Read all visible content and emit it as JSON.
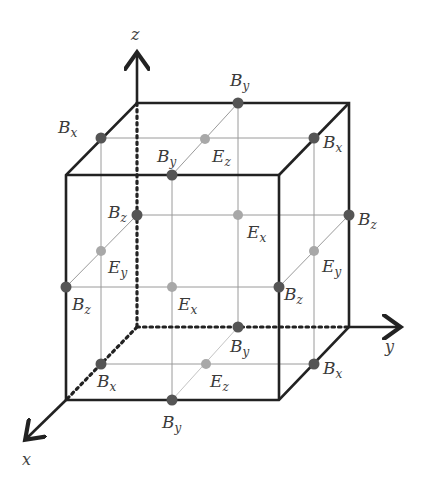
{
  "figure": {
    "colors": {
      "edge": "#222222",
      "grid_line": "#9a9a9a",
      "b_dot": "#555555",
      "e_dot": "#a8a8a8",
      "label": "#3a3a3a"
    }
  },
  "axes": {
    "x": {
      "label": "x"
    },
    "y": {
      "label": "y"
    },
    "z": {
      "label": "z"
    }
  },
  "points": [
    {
      "id": "bx-top-left",
      "field": "B",
      "comp": "x",
      "type": "B",
      "cx": 101,
      "cy": 138,
      "lx": 58,
      "ly": 133
    },
    {
      "id": "by-top-back",
      "field": "B",
      "comp": "y",
      "type": "B",
      "cx": 238,
      "cy": 103,
      "lx": 230,
      "ly": 86
    },
    {
      "id": "ez-top",
      "field": "E",
      "comp": "z",
      "type": "E",
      "cx": 205,
      "cy": 139,
      "lx": 212,
      "ly": 162
    },
    {
      "id": "bx-top-right",
      "field": "B",
      "comp": "x",
      "type": "B",
      "cx": 314,
      "cy": 138,
      "lx": 323,
      "ly": 148
    },
    {
      "id": "by-top-front",
      "field": "B",
      "comp": "y",
      "type": "B",
      "cx": 172,
      "cy": 175,
      "lx": 157,
      "ly": 162
    },
    {
      "id": "bz-back-left",
      "field": "B",
      "comp": "z",
      "type": "B",
      "cx": 137,
      "cy": 215,
      "lx": 108,
      "ly": 218
    },
    {
      "id": "ex-back",
      "field": "E",
      "comp": "x",
      "type": "E",
      "cx": 238,
      "cy": 215,
      "lx": 247,
      "ly": 238
    },
    {
      "id": "bz-back-right",
      "field": "B",
      "comp": "z",
      "type": "B",
      "cx": 349,
      "cy": 215,
      "lx": 358,
      "ly": 225
    },
    {
      "id": "ey-left",
      "field": "E",
      "comp": "y",
      "type": "E",
      "cx": 101,
      "cy": 251,
      "lx": 108,
      "ly": 273
    },
    {
      "id": "ey-right",
      "field": "E",
      "comp": "y",
      "type": "E",
      "cx": 314,
      "cy": 251,
      "lx": 322,
      "ly": 272
    },
    {
      "id": "bz-front-left",
      "field": "B",
      "comp": "z",
      "type": "B",
      "cx": 66,
      "cy": 287,
      "lx": 72,
      "ly": 310
    },
    {
      "id": "ex-front",
      "field": "E",
      "comp": "x",
      "type": "E",
      "cx": 172,
      "cy": 287,
      "lx": 178,
      "ly": 310
    },
    {
      "id": "bz-front-right",
      "field": "B",
      "comp": "z",
      "type": "B",
      "cx": 279,
      "cy": 287,
      "lx": 284,
      "ly": 300
    },
    {
      "id": "by-bottom-back",
      "field": "B",
      "comp": "y",
      "type": "B",
      "cx": 238,
      "cy": 327,
      "lx": 230,
      "ly": 352
    },
    {
      "id": "bx-bottom-left",
      "field": "B",
      "comp": "x",
      "type": "B",
      "cx": 101,
      "cy": 364,
      "lx": 97,
      "ly": 387
    },
    {
      "id": "ez-bottom",
      "field": "E",
      "comp": "z",
      "type": "E",
      "cx": 206,
      "cy": 364,
      "lx": 210,
      "ly": 387
    },
    {
      "id": "bx-bottom-right",
      "field": "B",
      "comp": "x",
      "type": "B",
      "cx": 314,
      "cy": 364,
      "lx": 323,
      "ly": 374
    },
    {
      "id": "by-bottom-front",
      "field": "B",
      "comp": "y",
      "type": "B",
      "cx": 172,
      "cy": 400,
      "lx": 162,
      "ly": 428
    }
  ]
}
